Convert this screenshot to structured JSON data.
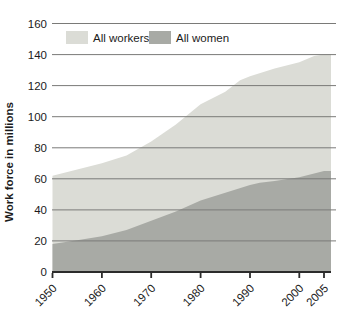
{
  "chart_data": {
    "type": "area",
    "title": "",
    "xlabel": "",
    "ylabel": "Work force in millions",
    "x_ticks": [
      1950,
      1960,
      1970,
      1980,
      1990,
      2000,
      2005
    ],
    "y_ticks": [
      0,
      20,
      40,
      60,
      80,
      100,
      120,
      140,
      160
    ],
    "xlim": [
      1950,
      2005
    ],
    "ylim": [
      0,
      160
    ],
    "grid": "horizontal-only",
    "legend_position": "top-inside",
    "series": [
      {
        "name": "All workers",
        "color": "#dbdcd6",
        "x": [
          1950,
          1955,
          1960,
          1965,
          1970,
          1975,
          1980,
          1985,
          1988,
          1990,
          1995,
          2000,
          2003,
          2005
        ],
        "values": [
          62,
          66,
          70,
          75,
          84,
          95,
          108,
          116,
          123.5,
          126,
          131,
          135,
          139,
          140
        ]
      },
      {
        "name": "All women",
        "color": "#a8aaa5",
        "x": [
          1950,
          1955,
          1960,
          1965,
          1970,
          1975,
          1980,
          1985,
          1990,
          1992,
          1995,
          2000,
          2005
        ],
        "values": [
          18,
          20.5,
          23,
          27,
          33,
          39,
          46,
          51,
          56,
          57.5,
          58.5,
          61,
          65
        ]
      }
    ]
  },
  "style_colors": {
    "background": "#ffffff",
    "gridline": "#7a7a78",
    "axis": "#2b2b2b",
    "text": "#1b1b1b"
  }
}
